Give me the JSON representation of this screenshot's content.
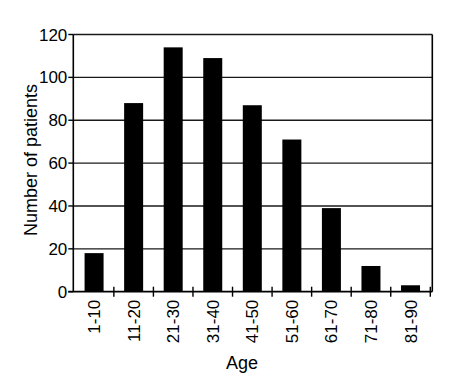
{
  "chart_data": {
    "type": "bar",
    "title": "",
    "xlabel": "Age",
    "ylabel": "Number of patients",
    "categories": [
      "1-10",
      "11-20",
      "21-30",
      "31-40",
      "41-50",
      "51-60",
      "61-70",
      "71-80",
      "81-90"
    ],
    "values": [
      18,
      88,
      114,
      109,
      87,
      71,
      39,
      12,
      3
    ],
    "ylim": [
      0,
      120
    ],
    "yticks": [
      0,
      20,
      40,
      60,
      80,
      100,
      120
    ],
    "grid": true,
    "legend": null,
    "bar_color": "#000000",
    "xtick_rotation": -90
  }
}
